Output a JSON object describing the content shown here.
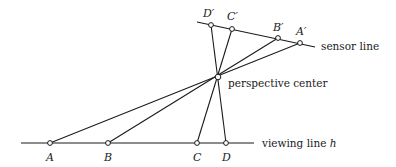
{
  "diagram": {
    "sensor_line": {
      "label": "sensor line",
      "start": [
        197,
        22
      ],
      "end": [
        315,
        47
      ],
      "label_pos": [
        321,
        50
      ]
    },
    "viewing_line": {
      "label": "viewing line h",
      "start": [
        21,
        143
      ],
      "end": [
        254,
        143
      ],
      "label_pos": [
        262,
        147
      ]
    },
    "perspective_center": {
      "label": "perspective center",
      "pos": [
        218,
        77
      ],
      "label_pos": [
        228,
        87
      ]
    },
    "ground_points": [
      {
        "label": "A",
        "pos": [
          50,
          143
        ],
        "label_pos": [
          46,
          161
        ]
      },
      {
        "label": "B",
        "pos": [
          108,
          143
        ],
        "label_pos": [
          104,
          161
        ]
      },
      {
        "label": "C",
        "pos": [
          197,
          143
        ],
        "label_pos": [
          193,
          161
        ]
      },
      {
        "label": "D",
        "pos": [
          226,
          143
        ],
        "label_pos": [
          222,
          161
        ]
      }
    ],
    "image_points": [
      {
        "label": "D′",
        "pos": [
          211,
          25
        ],
        "label_pos": [
          203,
          17
        ]
      },
      {
        "label": "C′",
        "pos": [
          232,
          29
        ],
        "label_pos": [
          227,
          20
        ]
      },
      {
        "label": "B′",
        "pos": [
          278,
          38
        ],
        "label_pos": [
          273,
          31
        ]
      },
      {
        "label": "A′",
        "pos": [
          300,
          43
        ],
        "label_pos": [
          296,
          35
        ]
      }
    ]
  }
}
